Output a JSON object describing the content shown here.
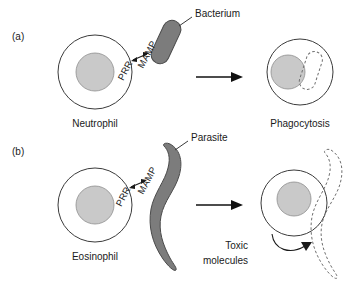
{
  "figure": {
    "background": "#ffffff",
    "colors": {
      "cell_fill": "#ffffff",
      "cell_stroke": "#3b3b3b",
      "nucleus_fill": "#c9c9c9",
      "microbe_fill": "#7c7c7c",
      "ghost_stroke": "#6f6f6f",
      "text": "#1a1a1a",
      "arrow": "#111111"
    }
  },
  "panels": [
    {
      "id": "panel-a",
      "label": "(a)",
      "cell_label": "Neutrophil",
      "receptor_label": "PRR",
      "ligand_label": "MAMP",
      "microbe_label": "Bacterium",
      "outcome_label": "Phagocytosis"
    },
    {
      "id": "panel-b",
      "label": "(b)",
      "cell_label": "Eosinophil",
      "receptor_label": "PRR",
      "ligand_label": "MAMP",
      "microbe_label": "Parasite",
      "outcome_label": "Toxic",
      "outcome_label_line2": "molecules"
    }
  ]
}
